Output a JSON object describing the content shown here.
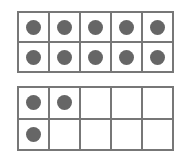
{
  "diagram": {
    "type": "ten-frames",
    "dot_color": "#666666",
    "line_color": "#777777",
    "frames": [
      {
        "name": "top-ten-frame",
        "filled": [
          true,
          true,
          true,
          true,
          true,
          true,
          true,
          true,
          true,
          true
        ],
        "count": 10
      },
      {
        "name": "bottom-ten-frame",
        "filled": [
          true,
          true,
          false,
          false,
          false,
          true,
          false,
          false,
          false,
          false
        ],
        "count": 3
      }
    ],
    "total": 13
  }
}
